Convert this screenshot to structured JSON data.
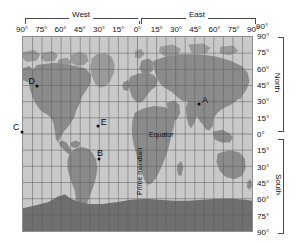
{
  "map": {
    "title": "World map with latitude and longitude grid",
    "projection": "equirectangular",
    "hemispheres": {
      "west_label": "West",
      "east_label": "East",
      "north_label": "North",
      "south_label": "South"
    },
    "longitude_axis": {
      "position": "top",
      "ticks": [
        "90°",
        "75°",
        "60°",
        "45°",
        "30°",
        "15°",
        "0°",
        "15°",
        "30°",
        "45°",
        "60°",
        "75°",
        "90°"
      ],
      "values": [
        -90,
        -75,
        -60,
        -45,
        -30,
        -15,
        0,
        15,
        30,
        45,
        60,
        75,
        90
      ]
    },
    "latitude_axis": {
      "position": "right",
      "ticks": [
        "90°",
        "75°",
        "60°",
        "45°",
        "30°",
        "15°",
        "0°",
        "15°",
        "30°",
        "45°",
        "60°",
        "75°",
        "90°"
      ],
      "values": [
        90,
        75,
        60,
        45,
        30,
        15,
        0,
        -15,
        -30,
        -45,
        -60,
        -75,
        -90
      ],
      "corner_label": "90°"
    },
    "annotations": [
      {
        "id": "prime-meridian",
        "text": "Prime meridian",
        "orientation": "vertical"
      },
      {
        "id": "equator",
        "text": "Equator",
        "orientation": "horizontal"
      }
    ],
    "points": [
      {
        "label": "A",
        "lon": 48,
        "lat": 28,
        "label_side": "right"
      },
      {
        "label": "B",
        "lon": -30,
        "lat": -23,
        "label_side": "above"
      },
      {
        "label": "C",
        "lon": -90,
        "lat": 2,
        "label_side": "left"
      },
      {
        "label": "D",
        "lon": -78,
        "lat": 44,
        "label_side": "left"
      },
      {
        "label": "E",
        "lon": -31,
        "lat": 7,
        "label_side": "right"
      }
    ],
    "colors": {
      "ocean": "#c9c9c9",
      "land": "#8b8b8b",
      "ice": "#e2e2e2",
      "antarctica": "#6f6f6f",
      "grid": "#5d5d5d",
      "border": "#8d8d8d",
      "text": "#111111",
      "point": "#0d0d0d"
    }
  }
}
